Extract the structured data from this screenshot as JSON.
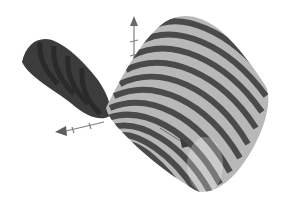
{
  "figure": {
    "colors": {
      "background": "#ffffff",
      "stripe_dark": "#4a4a4a",
      "stripe_light": "#b4b4b4",
      "back_face": "#3a3a3a",
      "axis": "#7a7a7a"
    },
    "axes": [
      {
        "name": "z-axis",
        "direction": "up"
      },
      {
        "name": "x-axis",
        "direction": "left"
      },
      {
        "name": "y-axis",
        "direction": "right-down"
      }
    ]
  }
}
